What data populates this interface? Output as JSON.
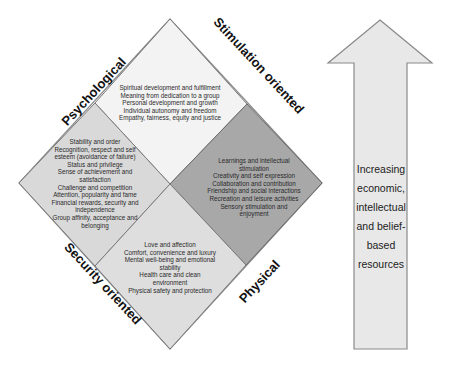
{
  "diagram": {
    "axes": {
      "top_left": "Psychological",
      "top_right": "Stimulation oriented",
      "bottom_left": "Security oriented",
      "bottom_right": "Physical"
    },
    "quadrants": {
      "top": {
        "color": "#f2f2f2",
        "lines": [
          "Spiritual development and fulfillment",
          "Meaning from dedication to a group",
          "Personal development and growth",
          "Individual autonomy and freedom",
          "Empathy, fairness, equity and justice"
        ]
      },
      "left": {
        "color": "#d8d8d8",
        "lines": [
          "Stability and order",
          "Recognition, respect and self",
          "esteem (avoidance of failure)",
          "Status and privilege",
          "Sense of achievement and",
          "satisfaction",
          "Challenge and competition",
          "Attention, popularity and fame",
          "Financial rewards, security and",
          "independence",
          "Group affinity, acceptance and",
          "belonging"
        ]
      },
      "right": {
        "color": "#a9a9a9",
        "lines": [
          "Learnings and intellectual",
          "stimulation",
          "Creativity and self expression",
          "Collaboration and contribution",
          "Friendship and social interactions",
          "Recreation and leisure activities",
          "Sensory stimulation and",
          "enjoyment"
        ]
      },
      "bottom": {
        "color": "#dcdcdc",
        "lines": [
          "Love and affection",
          "Comfort, convenience and luxury",
          "Mental well-being and emotional",
          "stability",
          "Health care and clean",
          "environment",
          "Physical safety and protection"
        ]
      }
    },
    "arrow": {
      "color": "#e6e6e6",
      "lines": [
        "Increasing",
        "economic,",
        "intellectual",
        "and belief-",
        "based",
        "resources"
      ]
    }
  }
}
